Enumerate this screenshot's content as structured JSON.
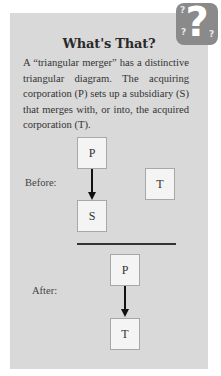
{
  "sidebar_box": {
    "icon": "question-mark-icon",
    "title": "What's That?",
    "body": "A “triangular merger” has a distinctive triangular diagram. The acquiring corporation (P) sets up a subsidiary (S) that merges with, or into, the acquired corporation (T)."
  },
  "diagram": {
    "before": {
      "label": "Before:",
      "parent": "P",
      "subsidiary": "S",
      "target": "T"
    },
    "after": {
      "label": "After:",
      "parent": "P",
      "target": "T"
    }
  },
  "colors": {
    "panel_background": "#d9d9d9",
    "badge": "#8a8a8a",
    "box_fill": "#f4f4f4"
  }
}
